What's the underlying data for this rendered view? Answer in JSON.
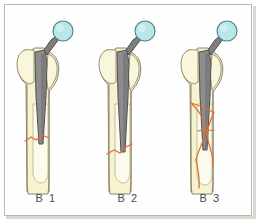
{
  "figure": {
    "background_color": "#ffffff",
    "frame_color": "#b9b7ae"
  },
  "palette": {
    "bone_fill": "#f7f2cf",
    "bone_fill_light": "#fbf8e4",
    "bone_outline": "#8c8468",
    "prosthesis_stem_fill": "#8d8d8d",
    "prosthesis_stem_fill_dark": "#6f6f6f",
    "prosthesis_outline": "#4f4f4f",
    "femoral_head_fill": "#b9e6e6",
    "femoral_head_outline": "#4f7f82",
    "fracture_line": "#e0702f",
    "label_color": "#4a4a4a"
  },
  "panels": [
    {
      "id": "b1",
      "label": "B 1",
      "description": "Periprosthetic fracture around a well-fixed stem; simple transverse fracture line at the level of the stem tip",
      "fracture_type": "transverse",
      "fracture_level": "stem tip",
      "stem_fixation": "stable",
      "bone_stock": "adequate",
      "parts": {
        "femoral_head": "femoral-head-ball",
        "neck": "prosthesis-neck",
        "stem": "prosthesis-stem",
        "greater_trochanter": "greater-trochanter",
        "femoral_shaft": "femoral-shaft",
        "medullary_canal": "medullary-canal",
        "fracture": "fracture-line"
      }
    },
    {
      "id": "b2",
      "label": "B 2",
      "description": "Periprosthetic fracture with a loose stem; oblique fracture line distal to the stem tip",
      "fracture_type": "oblique",
      "fracture_level": "distal to stem tip",
      "stem_fixation": "loose",
      "bone_stock": "adequate",
      "parts": {
        "femoral_head": "femoral-head-ball",
        "neck": "prosthesis-neck",
        "stem": "prosthesis-stem",
        "greater_trochanter": "greater-trochanter",
        "femoral_shaft": "femoral-shaft",
        "medullary_canal": "medullary-canal",
        "fracture": "fracture-line"
      }
    },
    {
      "id": "b3",
      "label": "B 3",
      "description": "Periprosthetic fracture with a loose stem and poor proximal bone stock; long comminuted spiral fracture with butterfly fragment",
      "fracture_type": "comminuted spiral",
      "fracture_level": "along the stem and distal shaft",
      "stem_fixation": "loose",
      "bone_stock": "deficient",
      "parts": {
        "femoral_head": "femoral-head-ball",
        "neck": "prosthesis-neck",
        "stem": "prosthesis-stem",
        "greater_trochanter": "greater-trochanter",
        "femoral_shaft": "femoral-shaft",
        "medullary_canal": "medullary-canal",
        "fracture": "fracture-line"
      }
    }
  ]
}
